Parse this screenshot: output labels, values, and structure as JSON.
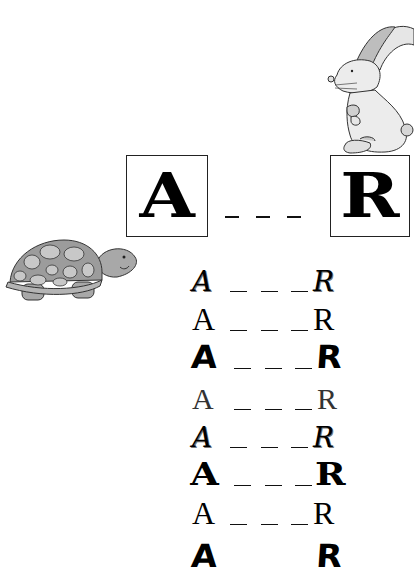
{
  "worksheet": {
    "start_letter": "A",
    "end_letter": "R",
    "blank": "_ _ _",
    "images": {
      "rabbit": "rabbit-illustration",
      "turtle": "turtle-illustration"
    },
    "colors": {
      "ink": "#000000",
      "rabbit_fill": "#e8e8e8",
      "rabbit_ear": "#bdbdbd",
      "turtle_shell": "#9c9c9c",
      "turtle_spots": "#c8c8c8",
      "turtle_body": "#a8a8a8"
    },
    "practice_rows": [
      {
        "left": "A",
        "right": "R",
        "style": "decorative"
      },
      {
        "left": "A",
        "right": "R",
        "style": "serif"
      },
      {
        "left": "A",
        "right": "R",
        "style": "heavy"
      },
      {
        "left": "A",
        "right": "R",
        "style": "light"
      },
      {
        "left": "A",
        "right": "R",
        "style": "decorative"
      },
      {
        "left": "A",
        "right": "R",
        "style": "block"
      },
      {
        "left": "A",
        "right": "R",
        "style": "serif"
      },
      {
        "left": "A",
        "right": "R",
        "style": "heavy"
      }
    ]
  }
}
